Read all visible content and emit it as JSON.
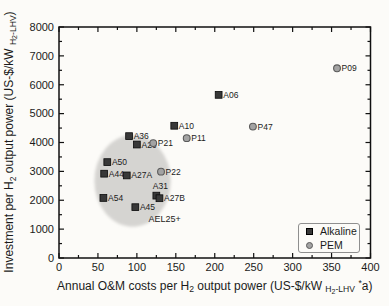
{
  "figure": {
    "background": "#fcfbf8",
    "text_color": "#1b1b1b",
    "frame_color": "#111111"
  },
  "legend": {
    "position": "lower-right",
    "items": [
      {
        "label": "Alkaline",
        "marker": "square",
        "fill": "#383838",
        "edge": "#000000"
      },
      {
        "label": "PEM",
        "marker": "circle",
        "fill": "#a3a3a3",
        "edge": "#5a5a5a"
      }
    ]
  },
  "chart_data": {
    "type": "scatter",
    "title": "",
    "xlabel": "Annual O&M costs per H2 output power (US-$/kW H2-LHV *a)",
    "ylabel": "Investment per H2 output power (US-$/kW H2-LHV)",
    "xlabel_segments": [
      {
        "text": "Annual O&M costs per H",
        "style": "normal"
      },
      {
        "text": "2",
        "style": "sub"
      },
      {
        "text": " output power (US-$/kW ",
        "style": "normal"
      },
      {
        "text": "H",
        "style": "sub"
      },
      {
        "text": "2",
        "style": "subsub"
      },
      {
        "text": "-LHV",
        "style": "sub"
      },
      {
        "text": " ",
        "style": "normal"
      },
      {
        "text": "*",
        "style": "sup"
      },
      {
        "text": "a)",
        "style": "normal"
      }
    ],
    "ylabel_segments": [
      {
        "text": "Investment per H",
        "style": "normal"
      },
      {
        "text": "2",
        "style": "sub"
      },
      {
        "text": " output power (US-$/kW ",
        "style": "normal"
      },
      {
        "text": "H",
        "style": "sub"
      },
      {
        "text": "2",
        "style": "subsub"
      },
      {
        "text": "-LHV",
        "style": "sub"
      },
      {
        "text": ")",
        "style": "normal"
      }
    ],
    "xlim": [
      0,
      400
    ],
    "ylim": [
      0,
      8000
    ],
    "x_major_tick": 50,
    "x_minor_tick": 25,
    "y_major_tick": 1000,
    "y_minor_tick": 500,
    "grid": false,
    "legend_position": "lower right",
    "series": [
      {
        "name": "Alkaline",
        "marker": "square",
        "fill": "#383838",
        "edge": "#0a0a0a",
        "points": [
          {
            "label": "A06",
            "x": 205,
            "y": 5650
          },
          {
            "label": "A10",
            "x": 148,
            "y": 4580
          },
          {
            "label": "A36",
            "x": 90,
            "y": 4220
          },
          {
            "label": "A26",
            "x": 100,
            "y": 3930
          },
          {
            "label": "A50",
            "x": 62,
            "y": 3320
          },
          {
            "label": "A44",
            "x": 58,
            "y": 2920
          },
          {
            "label": "A27A",
            "x": 87,
            "y": 2860
          },
          {
            "label": "A31",
            "x": 125,
            "y": 2160,
            "label_pos": "above"
          },
          {
            "label": "A27B",
            "x": 129,
            "y": 2070
          },
          {
            "label": "A54",
            "x": 57,
            "y": 2080
          },
          {
            "label": "A45",
            "x": 98,
            "y": 1760
          }
        ]
      },
      {
        "name": "PEM",
        "marker": "circle",
        "fill": "#a3a3a3",
        "edge": "#5a5a5a",
        "points": [
          {
            "label": "P09",
            "x": 357,
            "y": 6570
          },
          {
            "label": "P47",
            "x": 249,
            "y": 4550
          },
          {
            "label": "P11",
            "x": 164,
            "y": 4150
          },
          {
            "label": "P21",
            "x": 121,
            "y": 3980
          },
          {
            "label": "P22",
            "x": 131,
            "y": 2990
          }
        ]
      }
    ],
    "annotations": [
      {
        "text": "AEL25+",
        "x": 115,
        "y": 1250
      }
    ],
    "highlight_ellipse": {
      "cx": 94.5,
      "cy": 2670,
      "rx": 49,
      "ry": 1590,
      "color": "#d5d4d1"
    }
  }
}
